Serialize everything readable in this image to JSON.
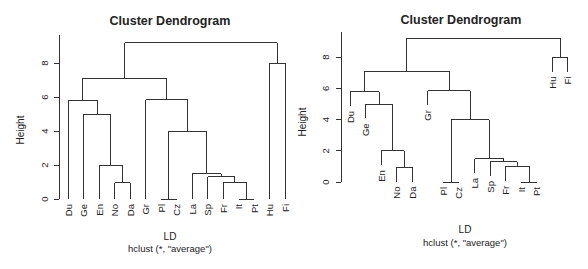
{
  "chart_data": [
    {
      "type": "dendrogram",
      "title": "Cluster Dendrogram",
      "xlabel": "LD",
      "sublabel": "hclust (*, \"average\")",
      "ylabel": "Height",
      "ylim": [
        0,
        9.2
      ],
      "yticks": [
        0,
        2,
        4,
        6,
        8
      ],
      "hang": false,
      "leaves": [
        "Du",
        "Ge",
        "En",
        "No",
        "Da",
        "Gr",
        "Pl",
        "Cz",
        "La",
        "Sp",
        "Fr",
        "It",
        "Pt",
        "Hu",
        "Fi"
      ],
      "merges": [
        {
          "a": "Pl",
          "b": "Cz",
          "height": 0.0
        },
        {
          "a": "It",
          "b": "Pt",
          "height": 0.0
        },
        {
          "a": "No",
          "b": "Da",
          "height": 0.95
        },
        {
          "a": "Fr",
          "b": "[It,Pt]",
          "height": 1.0
        },
        {
          "a": "Sp",
          "b": "[Fr,It,Pt]",
          "height": 1.3
        },
        {
          "a": "La",
          "b": "[Sp,Fr,It,Pt]",
          "height": 1.5
        },
        {
          "a": "En",
          "b": "[No,Da]",
          "height": 2.0
        },
        {
          "a": "[Pl,Cz]",
          "b": "[La,Sp,Fr,It,Pt]",
          "height": 4.0
        },
        {
          "a": "Ge",
          "b": "[En,No,Da]",
          "height": 5.0
        },
        {
          "a": "Du",
          "b": "[Ge,En,No,Da]",
          "height": 5.8
        },
        {
          "a": "Gr",
          "b": "[Pl,Cz,La,Sp,Fr,It,Pt]",
          "height": 5.85
        },
        {
          "a": "[Du..Da]",
          "b": "[Gr..Pt]",
          "height": 7.1
        },
        {
          "a": "Hu",
          "b": "Fi",
          "height": 8.0
        },
        {
          "a": "[Du..Pt]",
          "b": "[Hu,Fi]",
          "height": 9.2
        }
      ]
    },
    {
      "type": "dendrogram",
      "title": "Cluster Dendrogram",
      "xlabel": "LD",
      "sublabel": "hclust (*, \"average\")",
      "ylabel": "Height",
      "ylim": [
        0,
        9.2
      ],
      "yticks": [
        0,
        2,
        4,
        6,
        8
      ],
      "hang": true,
      "leaves": [
        "Du",
        "Ge",
        "En",
        "No",
        "Da",
        "Gr",
        "Pl",
        "Cz",
        "La",
        "Sp",
        "Fr",
        "It",
        "Pt",
        "Hu",
        "Fi"
      ],
      "merges": [
        {
          "a": "Pl",
          "b": "Cz",
          "height": 0.0
        },
        {
          "a": "It",
          "b": "Pt",
          "height": 0.0
        },
        {
          "a": "No",
          "b": "Da",
          "height": 0.95
        },
        {
          "a": "Fr",
          "b": "[It,Pt]",
          "height": 1.0
        },
        {
          "a": "Sp",
          "b": "[Fr,It,Pt]",
          "height": 1.3
        },
        {
          "a": "La",
          "b": "[Sp,Fr,It,Pt]",
          "height": 1.5
        },
        {
          "a": "En",
          "b": "[No,Da]",
          "height": 2.0
        },
        {
          "a": "[Pl,Cz]",
          "b": "[La,Sp,Fr,It,Pt]",
          "height": 4.0
        },
        {
          "a": "Ge",
          "b": "[En,No,Da]",
          "height": 5.0
        },
        {
          "a": "Du",
          "b": "[Ge,En,No,Da]",
          "height": 5.8
        },
        {
          "a": "Gr",
          "b": "[Pl,Cz,La,Sp,Fr,It,Pt]",
          "height": 5.85
        },
        {
          "a": "[Du..Da]",
          "b": "[Gr..Pt]",
          "height": 7.1
        },
        {
          "a": "Hu",
          "b": "Fi",
          "height": 8.0
        },
        {
          "a": "[Du..Pt]",
          "b": "[Hu,Fi]",
          "height": 9.2
        }
      ]
    }
  ],
  "tree": {
    "h": 9.2,
    "children": [
      {
        "h": 7.1,
        "children": [
          {
            "h": 5.8,
            "children": [
              {
                "leaf": 0
              },
              {
                "h": 5.0,
                "children": [
                  {
                    "leaf": 1
                  },
                  {
                    "h": 2.0,
                    "children": [
                      {
                        "leaf": 2
                      },
                      {
                        "h": 0.95,
                        "children": [
                          {
                            "leaf": 3
                          },
                          {
                            "leaf": 4
                          }
                        ]
                      }
                    ]
                  }
                ]
              }
            ]
          },
          {
            "h": 5.85,
            "children": [
              {
                "leaf": 5
              },
              {
                "h": 4.0,
                "children": [
                  {
                    "h": 0.0,
                    "children": [
                      {
                        "leaf": 6
                      },
                      {
                        "leaf": 7
                      }
                    ]
                  },
                  {
                    "h": 1.5,
                    "children": [
                      {
                        "leaf": 8
                      },
                      {
                        "h": 1.3,
                        "children": [
                          {
                            "leaf": 9
                          },
                          {
                            "h": 1.0,
                            "children": [
                              {
                                "leaf": 10
                              },
                              {
                                "h": 0.0,
                                "children": [
                                  {
                                    "leaf": 11
                                  },
                                  {
                                    "leaf": 12
                                  }
                                ]
                              }
                            ]
                          }
                        ]
                      }
                    ]
                  }
                ]
              }
            ]
          }
        ]
      },
      {
        "h": 8.0,
        "children": [
          {
            "leaf": 13
          },
          {
            "leaf": 14
          }
        ]
      }
    ]
  },
  "panels": [
    {
      "title": "Cluster Dendrogram",
      "ylabel": "Height",
      "xlabel": "LD",
      "sublabel": "hclust (*, \"average\")",
      "yticks": [
        "0",
        "2",
        "4",
        "6",
        "8"
      ]
    },
    {
      "title": "Cluster Dendrogram",
      "ylabel": "Height",
      "xlabel": "LD",
      "sublabel": "hclust (*, \"average\")",
      "yticks": [
        "0",
        "2",
        "4",
        "6",
        "8"
      ]
    }
  ],
  "colors": {
    "line": "#333333",
    "text": "#222222",
    "background": "#ffffff"
  }
}
